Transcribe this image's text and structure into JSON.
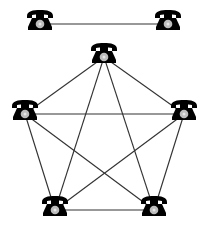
{
  "diagram": {
    "colors": {
      "background": "#ffffff",
      "line": "#333333",
      "phone": "#000000",
      "dial": "#bdbdbd"
    },
    "icon": "telephone-icon",
    "networks": [
      {
        "name": "two-phone-link",
        "nodes": [
          {
            "id": "A",
            "x": 40,
            "y": 21
          },
          {
            "id": "B",
            "x": 168,
            "y": 21
          }
        ],
        "edges": [
          [
            "A",
            "B"
          ]
        ]
      },
      {
        "name": "five-phone-full-mesh",
        "nodes": [
          {
            "id": "P1",
            "x": 104,
            "y": 54
          },
          {
            "id": "P2",
            "x": 25,
            "y": 111
          },
          {
            "id": "P3",
            "x": 184,
            "y": 111
          },
          {
            "id": "P4",
            "x": 55,
            "y": 207
          },
          {
            "id": "P5",
            "x": 154,
            "y": 207
          }
        ],
        "edges": [
          [
            "P1",
            "P2"
          ],
          [
            "P1",
            "P3"
          ],
          [
            "P1",
            "P4"
          ],
          [
            "P1",
            "P5"
          ],
          [
            "P2",
            "P3"
          ],
          [
            "P2",
            "P4"
          ],
          [
            "P2",
            "P5"
          ],
          [
            "P3",
            "P4"
          ],
          [
            "P3",
            "P5"
          ],
          [
            "P4",
            "P5"
          ]
        ]
      }
    ]
  }
}
